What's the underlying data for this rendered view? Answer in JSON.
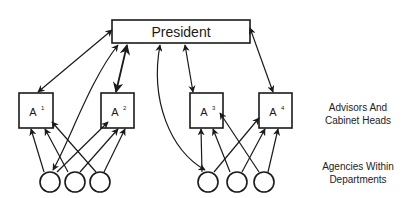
{
  "diagram": {
    "top_node": {
      "label": "President"
    },
    "advisors": [
      {
        "id": "A1",
        "base": "A",
        "sup": "1"
      },
      {
        "id": "A2",
        "base": "A",
        "sup": "2"
      },
      {
        "id": "A3",
        "base": "A",
        "sup": "3"
      },
      {
        "id": "A4",
        "base": "A",
        "sup": "4"
      }
    ],
    "agencies_count": 6,
    "labels": {
      "advisors_line1": "Advisors And",
      "advisors_line2": "Cabinet Heads",
      "agencies_line1": "Agencies Within",
      "agencies_line2": "Departments"
    },
    "colors": {
      "stroke": "#1a1a1a",
      "background": "#ffffff"
    }
  }
}
